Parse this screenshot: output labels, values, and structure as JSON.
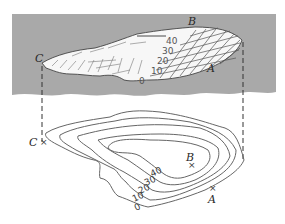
{
  "figure": {
    "type": "topographic-illustration",
    "top_panel": {
      "description": "3D relief view of a hill",
      "background_color": "#a8a8a8",
      "points": [
        {
          "label": "B",
          "role": "summit"
        },
        {
          "label": "A",
          "role": "steep slope foot"
        },
        {
          "label": "C",
          "role": "gentle slope end"
        }
      ],
      "contour_labels": [
        "40",
        "30",
        "20",
        "10",
        "0"
      ]
    },
    "bottom_panel": {
      "description": "Contour map of the same hill",
      "points": [
        {
          "label": "C",
          "marker": "×"
        },
        {
          "label": "B",
          "marker": "×"
        },
        {
          "label": "A",
          "marker": "×"
        }
      ],
      "contour_labels": [
        "40",
        "30",
        "20",
        "10",
        "0"
      ]
    },
    "projection_lines": "dashed"
  }
}
